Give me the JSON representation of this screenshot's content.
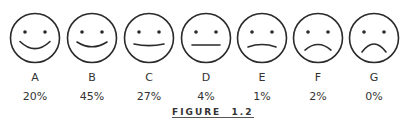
{
  "chart_data": {
    "type": "table",
    "categories": [
      "A",
      "B",
      "C",
      "D",
      "E",
      "F",
      "G"
    ],
    "faces": [
      "big-smile",
      "smile",
      "slight-smile",
      "neutral",
      "slight-frown",
      "frown",
      "big-frown"
    ],
    "values": [
      20,
      45,
      27,
      4,
      1,
      2,
      0
    ],
    "value_labels": [
      "20%",
      "45%",
      "27%",
      "4%",
      "1%",
      "2%",
      "0%"
    ]
  },
  "caption": {
    "figure_word": "FIGURE",
    "figure_number": "1.2"
  },
  "colors": {
    "stroke": "#2a2a2a",
    "background": "#ffffff"
  }
}
